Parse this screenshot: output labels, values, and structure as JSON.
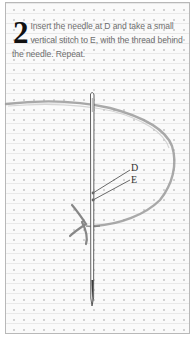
{
  "instruction": {
    "step_number": "2",
    "text": "Insert the needle at D and take a small vertical stitch to E, with the thread behind the needle. Repeat."
  },
  "diagram": {
    "points": [
      {
        "label": "D"
      },
      {
        "label": "E"
      }
    ],
    "colors": {
      "thread": "#8c8c8c",
      "needle": "#555555",
      "fabric_dot": "#d2d2d2",
      "border": "#b8b8b8",
      "step_number": "#111111",
      "text": "#6e6e6e"
    }
  }
}
